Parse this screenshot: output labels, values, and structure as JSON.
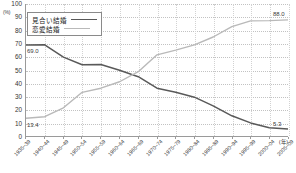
{
  "chart_data": {
    "type": "line",
    "title": "",
    "xlabel": "(年)",
    "ylabel": "(%)",
    "ylim": [
      0,
      100
    ],
    "ytick_values": [
      0,
      10,
      20,
      30,
      40,
      50,
      60,
      70,
      80,
      90,
      100
    ],
    "ytick_labels": [
      "0",
      "10",
      "20",
      "30",
      "40",
      "50",
      "60",
      "70",
      "80",
      "90",
      "100"
    ],
    "grid": true,
    "legend_position": "upper-left",
    "categories": [
      "1935~39",
      "1940~44",
      "1945~49",
      "1950~54",
      "1955~59",
      "1960~64",
      "1965~69",
      "1970~74",
      "1975~79",
      "1980~84",
      "1985~89",
      "1990~94",
      "1995~99",
      "2000~04",
      "2005~09"
    ],
    "series": [
      {
        "name": "見合い結婚",
        "color": "#595959",
        "values": [
          69.0,
          69.1,
          59.8,
          54.0,
          54.2,
          49.8,
          44.9,
          36.2,
          33.1,
          29.4,
          22.8,
          15.3,
          9.9,
          6.2,
          5.3
        ]
      },
      {
        "name": "恋愛結婚",
        "color": "#b9b9b9",
        "values": [
          13.4,
          14.6,
          21.4,
          33.1,
          36.2,
          41.1,
          48.7,
          61.5,
          65.0,
          69.0,
          75.0,
          82.8,
          87.2,
          87.4,
          88.0
        ]
      }
    ],
    "annotations": [
      {
        "id": "miai-start",
        "text": "69.0",
        "series": "見合い結婚",
        "category": "1935~39",
        "value": 69.0
      },
      {
        "id": "miai-end",
        "text": "5.3",
        "series": "見合い結婚",
        "category": "2005~09",
        "value": 5.3
      },
      {
        "id": "renai-start",
        "text": "13.4",
        "series": "恋愛結婚",
        "category": "1935~39",
        "value": 13.4
      },
      {
        "id": "renai-end",
        "text": "88.0",
        "series": "恋愛結婚",
        "category": "2005~09",
        "value": 88.0
      }
    ]
  },
  "legend": {
    "items": [
      {
        "label": "見合い結婚",
        "style": "dark"
      },
      {
        "label": "恋愛結婚",
        "style": "light"
      }
    ]
  },
  "axis": {
    "y_unit": "(%)",
    "x_unit": "(年)"
  }
}
